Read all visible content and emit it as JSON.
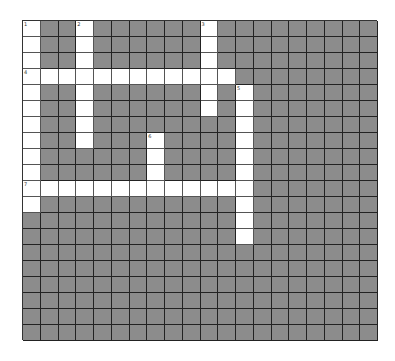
{
  "puzzle": {
    "rows": 20,
    "cols": 20,
    "colors": {
      "block": "#8c8c8c",
      "open": "#ffffff",
      "line": "#222222"
    },
    "entries": [
      {
        "number": "1",
        "direction": "down",
        "row": 0,
        "col": 0,
        "length": 12
      },
      {
        "number": "2",
        "direction": "down",
        "row": 0,
        "col": 3,
        "length": 8
      },
      {
        "number": "3",
        "direction": "down",
        "row": 0,
        "col": 10,
        "length": 6
      },
      {
        "number": "4",
        "direction": "across",
        "row": 3,
        "col": 0,
        "length": 12
      },
      {
        "number": "5",
        "direction": "down",
        "row": 4,
        "col": 12,
        "length": 10
      },
      {
        "number": "6",
        "direction": "down",
        "row": 7,
        "col": 7,
        "length": 4
      },
      {
        "number": "7",
        "direction": "across",
        "row": 10,
        "col": 0,
        "length": 13
      }
    ]
  }
}
